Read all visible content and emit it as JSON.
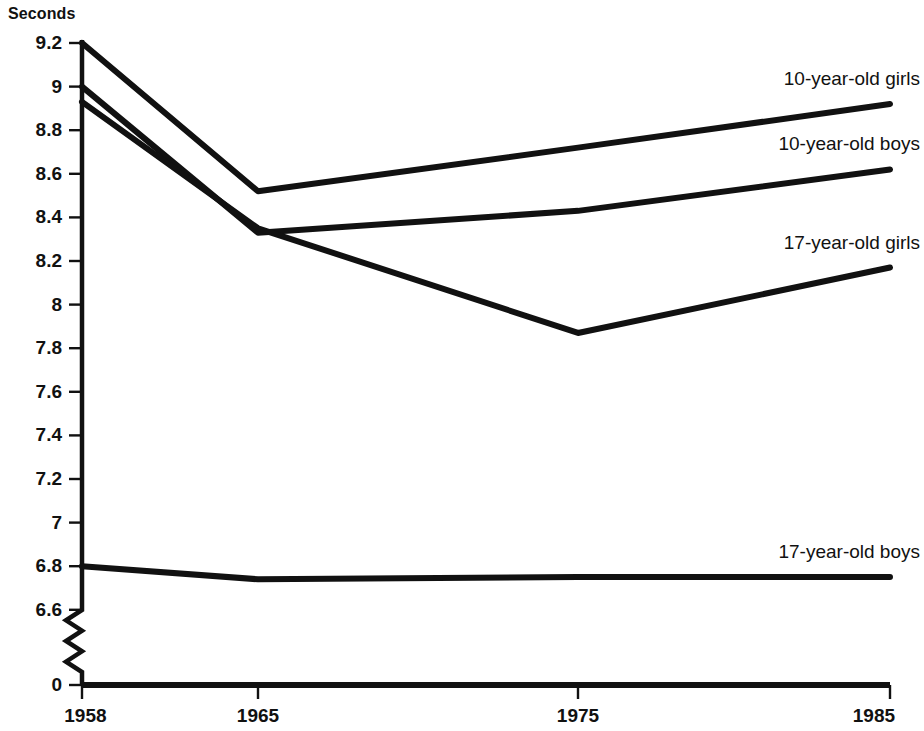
{
  "chart_data": {
    "type": "line",
    "title": "",
    "subtitle": "",
    "xlabel": "",
    "ylabel": "Seconds",
    "ylabel_position": "top-left",
    "x": [
      1958,
      1965,
      1975,
      1985
    ],
    "categories": [
      "1958",
      "1965",
      "1975",
      "1985"
    ],
    "xtick_labels": [
      "1958",
      "1965",
      "1975",
      "1985"
    ],
    "ytick_labels": [
      "9.2",
      "9",
      "8.8",
      "8.6",
      "8.4",
      "8.2",
      "8",
      "7.8",
      "7.6",
      "7.4",
      "7.2",
      "7",
      "6.8",
      "6.6",
      "0"
    ],
    "ytick_values": [
      9.2,
      9,
      8.8,
      8.6,
      8.4,
      8.2,
      8,
      7.8,
      7.6,
      7.4,
      7.2,
      7,
      6.8,
      6.6,
      0
    ],
    "ylim": [
      6.6,
      9.2
    ],
    "axis_break": true,
    "axis_break_note": "zigzag break on y-axis between 6.6 and 0",
    "grid": false,
    "legend_position": "inline-right",
    "line_color": "#111111",
    "background_color": "#ffffff",
    "series": [
      {
        "name": "10-year-old girls",
        "label": "10-year-old girls",
        "values": [
          9.2,
          8.52,
          8.72,
          8.92
        ]
      },
      {
        "name": "10-year-old boys",
        "label": "10-year-old boys",
        "values": [
          9.0,
          8.33,
          8.43,
          8.62
        ]
      },
      {
        "name": "17-year-old girls",
        "label": "17-year-old girls",
        "values": [
          8.93,
          8.35,
          7.87,
          8.17
        ]
      },
      {
        "name": "17-year-old boys",
        "label": "17-year-old boys",
        "values": [
          6.8,
          6.74,
          6.75,
          6.75
        ]
      }
    ]
  },
  "labels": {
    "unit": "Seconds",
    "series_0": "10-year-old girls",
    "series_1": "10-year-old boys",
    "series_2": "17-year-old girls",
    "series_3": "17-year-old boys",
    "y_0": "9.2",
    "y_1": "9",
    "y_2": "8.8",
    "y_3": "8.6",
    "y_4": "8.4",
    "y_5": "8.2",
    "y_6": "8",
    "y_7": "7.8",
    "y_8": "7.6",
    "y_9": "7.4",
    "y_10": "7.2",
    "y_11": "7",
    "y_12": "6.8",
    "y_13": "6.6",
    "y_14": "0",
    "x_0": "1958",
    "x_1": "1965",
    "x_2": "1975",
    "x_3": "1985"
  }
}
